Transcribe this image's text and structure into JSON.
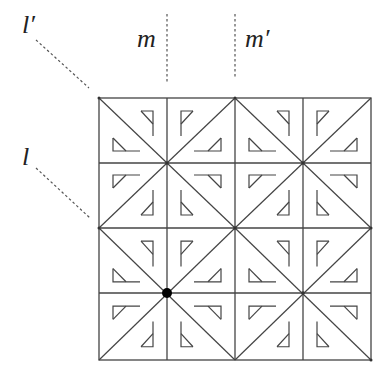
{
  "figure": {
    "colors": {
      "background": "#ffffff",
      "line": "#444444",
      "dotted": "#555555",
      "dot": "#000000",
      "label": "#222222"
    },
    "grid": {
      "rows": 4,
      "cols": 4,
      "x": [
        99,
        167,
        235,
        303,
        371
      ],
      "y": [
        98,
        163,
        228,
        293,
        360
      ]
    },
    "labels": {
      "l_prime": "l′",
      "m": "m",
      "m_prime": "m′",
      "l": "l"
    },
    "mirror_lines": {
      "m": {
        "x1": 167,
        "y1": 14,
        "x2": 167,
        "y2": 84
      },
      "m_prime": {
        "x1": 235,
        "y1": 14,
        "x2": 235,
        "y2": 79
      },
      "l_prime": {
        "x1": 36,
        "y1": 40,
        "x2": 89,
        "y2": 88
      },
      "l": {
        "x1": 36,
        "y1": 168,
        "x2": 90,
        "y2": 218
      }
    },
    "highlight_point": {
      "x": 167,
      "y": 293
    }
  }
}
